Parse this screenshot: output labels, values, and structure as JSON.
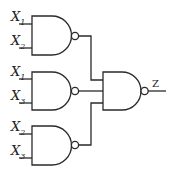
{
  "diagram": {
    "type": "logic-circuit",
    "gates": [
      {
        "id": "nand1",
        "type": "NAND",
        "inputs": [
          "X1",
          "X2"
        ]
      },
      {
        "id": "nand2",
        "type": "NAND",
        "inputs": [
          "X1",
          "X3"
        ]
      },
      {
        "id": "nand3",
        "type": "NAND",
        "inputs": [
          "X2",
          "X3"
        ]
      },
      {
        "id": "nand_out",
        "type": "NAND",
        "inputs": [
          "nand1",
          "nand2",
          "nand3"
        ],
        "output": "Z"
      }
    ],
    "labels": {
      "g1_in1": {
        "base": "X",
        "sub": "1"
      },
      "g1_in2": {
        "base": "X",
        "sub": "2"
      },
      "g2_in1": {
        "base": "X",
        "sub": "1"
      },
      "g2_in2": {
        "base": "X",
        "sub": "3"
      },
      "g3_in1": {
        "base": "X",
        "sub": "2"
      },
      "g3_in2": {
        "base": "X",
        "sub": "3"
      },
      "output": "Z"
    }
  }
}
